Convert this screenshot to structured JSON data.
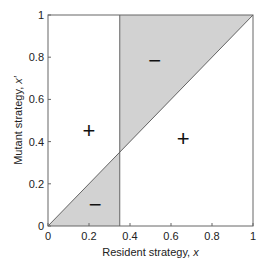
{
  "chart_data": {
    "type": "area",
    "title": "",
    "xlabel": "Resident strategy, ",
    "xlabel_var": "x",
    "ylabel": "Mutant strategy, ",
    "ylabel_var": "x′",
    "xlim": [
      0,
      1
    ],
    "ylim": [
      0,
      1
    ],
    "xticks": [
      0,
      0.2,
      0.4,
      0.6,
      0.8,
      1
    ],
    "xtick_labels": [
      "0",
      "0.2",
      "0.4",
      "0.6",
      "0.8",
      "1"
    ],
    "yticks": [
      0,
      0.2,
      0.4,
      0.6,
      0.8,
      1
    ],
    "ytick_labels": [
      "0",
      "0.2",
      "0.4",
      "0.6",
      "0.8",
      "1"
    ],
    "grid": false,
    "singular_strategy": 0.35,
    "regions": [
      {
        "name": "lower-negative",
        "sign": "-",
        "polygon": [
          [
            0,
            0
          ],
          [
            0.35,
            0
          ],
          [
            0.35,
            0.35
          ]
        ],
        "shaded": true
      },
      {
        "name": "upper-negative",
        "sign": "-",
        "polygon": [
          [
            0.35,
            0.35
          ],
          [
            0.35,
            1
          ],
          [
            1,
            1
          ]
        ],
        "shaded": true
      }
    ],
    "lines": [
      {
        "name": "diagonal",
        "points": [
          [
            0,
            0
          ],
          [
            1,
            1
          ]
        ]
      },
      {
        "name": "vertical-singular",
        "points": [
          [
            0.35,
            0
          ],
          [
            0.35,
            1
          ]
        ]
      }
    ],
    "annotations": [
      {
        "text": "+",
        "x": 0.2,
        "y": 0.45
      },
      {
        "text": "+",
        "x": 0.66,
        "y": 0.41
      },
      {
        "text": "−",
        "x": 0.52,
        "y": 0.78
      },
      {
        "text": "−",
        "x": 0.23,
        "y": 0.1
      }
    ],
    "colors": {
      "shade": "#d2d2d2",
      "line": "#555555",
      "axis": "#666666"
    }
  }
}
